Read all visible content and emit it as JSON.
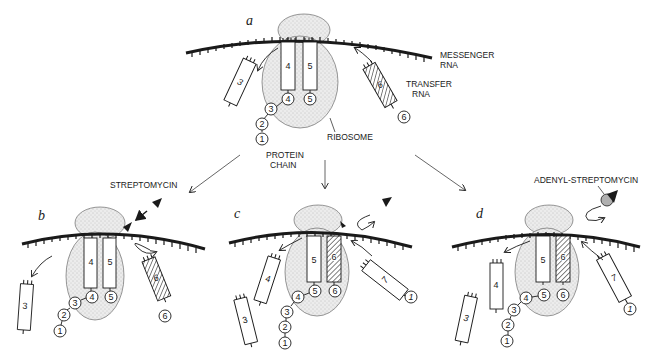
{
  "figure": {
    "panels": [
      {
        "id": "a",
        "label": "a"
      },
      {
        "id": "b",
        "label": "b"
      },
      {
        "id": "c",
        "label": "c"
      },
      {
        "id": "d",
        "label": "d"
      }
    ],
    "labels": {
      "messenger_rna_line1": "MESSENGER",
      "messenger_rna_line2": "RNA",
      "transfer_rna_line1": "TRANSFER",
      "transfer_rna_line2": "RNA",
      "ribosome": "RIBOSOME",
      "protein_chain_line1": "PROTEIN",
      "protein_chain_line2": "CHAIN",
      "streptomycin": "STREPTOMYCIN",
      "adenyl_streptomycin": "ADENYL-STREPTOMYCIN"
    },
    "panel_a": {
      "trna_left": "3",
      "trna_mid1": "4",
      "trna_mid2": "5",
      "trna_incoming": "6",
      "chain": [
        "1",
        "2",
        "3",
        "4"
      ],
      "bead_mid2": "5",
      "bead_incoming": "6"
    },
    "panel_b": {
      "trna_left": "3",
      "trna_mid1": "4",
      "trna_mid2": "5",
      "trna_rejected": "6",
      "chain": [
        "1",
        "2",
        "3",
        "4"
      ],
      "bead_mid2": "5",
      "bead_rejected": "6"
    },
    "panel_c": {
      "trna_far": "3",
      "trna_left": "4",
      "trna_mid1": "5",
      "trna_mid2": "6",
      "trna_incoming": "7",
      "chain": [
        "1",
        "2",
        "3",
        "4",
        "5"
      ],
      "bead_mid2": "6",
      "bead_incoming": "1"
    },
    "panel_d": {
      "trna_far": "3",
      "trna_left": "4",
      "trna_mid1": "5",
      "trna_mid2": "6",
      "trna_incoming": "7",
      "chain": [
        "1",
        "2",
        "3",
        "4",
        "5"
      ],
      "bead_mid2": "6",
      "bead_incoming": "1"
    }
  }
}
